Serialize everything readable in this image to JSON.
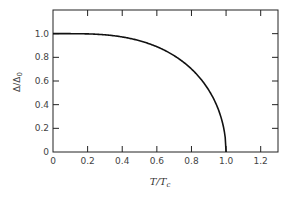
{
  "chart_data": {
    "type": "line",
    "title": "",
    "xlabel": "T/Tc",
    "ylabel": "Δ/Δ0",
    "xlim": [
      0,
      1.3
    ],
    "ylim": [
      0,
      1.2
    ],
    "grid": false,
    "legend": null,
    "x_ticks": [
      "0",
      "0.2",
      "0.4",
      "0.6",
      "0.8",
      "1.0",
      "1.2"
    ],
    "y_ticks": [
      "0",
      "0.2",
      "0.4",
      "0.6",
      "0.8",
      "1.0"
    ],
    "series": [
      {
        "name": "BCS gap",
        "x": [
          0,
          0.1,
          0.2,
          0.3,
          0.4,
          0.5,
          0.6,
          0.7,
          0.8,
          0.85,
          0.9,
          0.95,
          0.98,
          1.0
        ],
        "y": [
          1.0,
          1.0,
          0.999,
          0.99,
          0.975,
          0.95,
          0.91,
          0.84,
          0.74,
          0.66,
          0.56,
          0.4,
          0.25,
          0.0
        ]
      }
    ]
  },
  "labels": {
    "xlabel_main": "T/T",
    "xlabel_sub": "c",
    "ylabel_main": "Δ/Δ",
    "ylabel_sub": "0"
  }
}
